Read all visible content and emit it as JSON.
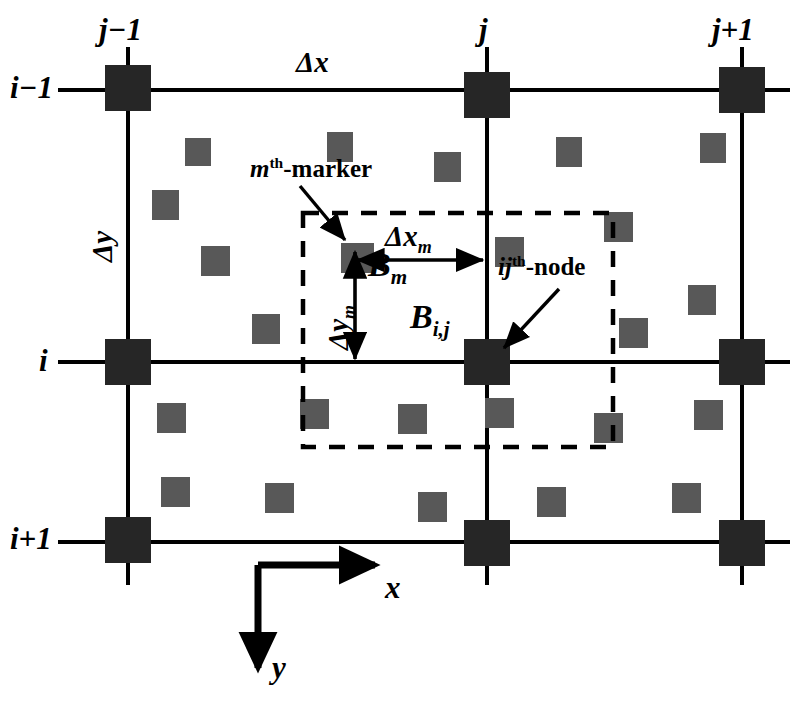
{
  "figure": {
    "kind": "staggered-grid-marker-in-cell-diagram",
    "background_color": "#ffffff",
    "line_color": "#000000",
    "node_color": "#262626",
    "marker_color": "#585858",
    "dashed_color": "#000000"
  },
  "column_labels": [
    {
      "id": "j-minus-1",
      "text": "j−1",
      "x": 128,
      "y": 22
    },
    {
      "id": "j",
      "text": "j",
      "x": 487,
      "y": 22
    },
    {
      "id": "j-plus-1",
      "text": "j+1",
      "x": 742,
      "y": 22
    }
  ],
  "row_labels": [
    {
      "id": "i-minus-1",
      "text": "i−1",
      "x": 40,
      "y": 88
    },
    {
      "id": "i",
      "text": "i",
      "x": 46,
      "y": 360
    },
    {
      "id": "i-plus-1",
      "text": "i+1",
      "x": 40,
      "y": 540
    }
  ],
  "spacing_labels": {
    "dx": "Δx",
    "dy": "Δy",
    "dx_marker_delta": "Δ",
    "dx_marker_var": "x",
    "dx_marker_sub": "m",
    "dy_marker_delta": "Δ",
    "dy_marker_var": "y",
    "dy_marker_sub": "m"
  },
  "callouts": [
    {
      "id": "mth-marker",
      "prefix": "m",
      "superscript": "th",
      "suffix": "-marker",
      "x": 250,
      "y": 168
    },
    {
      "id": "ijth-node",
      "prefix": "ij",
      "superscript": "th",
      "suffix": "-node",
      "x": 498,
      "y": 265
    }
  ],
  "field_labels": [
    {
      "id": "B-marker",
      "base": "B",
      "sub": "m",
      "x": 368,
      "y": 258
    },
    {
      "id": "B-node",
      "base": "B",
      "sub": "i,j",
      "x": 410,
      "y": 302
    }
  ],
  "axes": {
    "x_label": "x",
    "y_label": "y",
    "origin_x": 258,
    "origin_y": 565,
    "x_tip_x": 385,
    "y_tip_y": 678
  },
  "grid": {
    "columns_x": [
      128,
      487,
      742
    ],
    "rows_y": [
      88,
      362,
      540
    ],
    "node_size": 46,
    "line_width": 4
  },
  "nodes": [
    {
      "id": "node-i-1-j-1",
      "x": 128,
      "y": 88
    },
    {
      "id": "node-i-1-j",
      "x": 487,
      "y": 95
    },
    {
      "id": "node-i-1-j+1",
      "x": 742,
      "y": 90
    },
    {
      "id": "node-i-j-1",
      "x": 128,
      "y": 362
    },
    {
      "id": "node-i-j",
      "x": 487,
      "y": 362
    },
    {
      "id": "node-i-j+1",
      "x": 742,
      "y": 362
    },
    {
      "id": "node-i+1-j-1",
      "x": 128,
      "y": 540
    },
    {
      "id": "node-i+1-j",
      "x": 487,
      "y": 543
    },
    {
      "id": "node-i+1-j+1",
      "x": 742,
      "y": 543
    }
  ],
  "markers": [
    {
      "x": 185,
      "y": 138,
      "w": 26,
      "h": 28
    },
    {
      "x": 327,
      "y": 132,
      "w": 26,
      "h": 30
    },
    {
      "x": 434,
      "y": 152,
      "w": 27,
      "h": 30
    },
    {
      "x": 556,
      "y": 137,
      "w": 26,
      "h": 30
    },
    {
      "x": 700,
      "y": 133,
      "w": 26,
      "h": 30
    },
    {
      "x": 152,
      "y": 190,
      "w": 27,
      "h": 30
    },
    {
      "x": 201,
      "y": 246,
      "w": 29,
      "h": 30
    },
    {
      "x": 252,
      "y": 314,
      "w": 28,
      "h": 30
    },
    {
      "x": 345,
      "y": 243,
      "w": 29,
      "h": 30
    },
    {
      "x": 495,
      "y": 237,
      "w": 29,
      "h": 30
    },
    {
      "x": 604,
      "y": 212,
      "w": 29,
      "h": 30
    },
    {
      "x": 619,
      "y": 318,
      "w": 29,
      "h": 30
    },
    {
      "x": 688,
      "y": 285,
      "w": 28,
      "h": 30
    },
    {
      "x": 157,
      "y": 403,
      "w": 29,
      "h": 30
    },
    {
      "x": 300,
      "y": 399,
      "w": 29,
      "h": 30
    },
    {
      "x": 398,
      "y": 404,
      "w": 29,
      "h": 30
    },
    {
      "x": 485,
      "y": 398,
      "w": 29,
      "h": 30
    },
    {
      "x": 594,
      "y": 413,
      "w": 29,
      "h": 30
    },
    {
      "x": 694,
      "y": 400,
      "w": 29,
      "h": 30
    },
    {
      "x": 161,
      "y": 477,
      "w": 29,
      "h": 30
    },
    {
      "x": 265,
      "y": 483,
      "w": 29,
      "h": 30
    },
    {
      "x": 418,
      "y": 492,
      "w": 29,
      "h": 30
    },
    {
      "x": 537,
      "y": 487,
      "w": 29,
      "h": 30
    },
    {
      "x": 672,
      "y": 483,
      "w": 29,
      "h": 30
    }
  ],
  "marker_highlight": {
    "id": "mth-marker-square",
    "x": 341,
    "y": 243,
    "w": 29,
    "h": 30
  },
  "dashed_cell": {
    "x": 303,
    "y": 213,
    "width": 310,
    "height": 234
  },
  "measure_arrows": {
    "dx_m": {
      "x1": 355,
      "y1": 260,
      "x2": 487,
      "y2": 260
    },
    "dy_m": {
      "x1": 355,
      "y1": 258,
      "x2": 355,
      "y2": 362
    }
  },
  "chart_data": {
    "type": "diagram",
    "grid_columns": [
      "j−1",
      "j",
      "j+1"
    ],
    "grid_rows": [
      "i−1",
      "i",
      "i+1"
    ],
    "annotations": [
      "Δx",
      "Δy",
      "Δx_m",
      "Δy_m",
      "mᵗʰ-marker",
      "ijᵗʰ-node",
      "B_m",
      "B_i,j"
    ],
    "axis_directions": {
      "x": "right",
      "y": "down"
    },
    "node_count": 9,
    "marker_count": 24
  }
}
